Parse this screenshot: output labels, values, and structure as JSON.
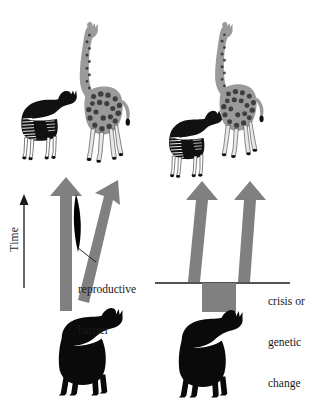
{
  "figure": {
    "background_color": "#ffffff",
    "arrow_color": "#808080",
    "barrier_color": "#000000",
    "ink_color": "#1a1a1a",
    "axis": {
      "label": "Time",
      "direction": "upward"
    },
    "panels": [
      {
        "id": "left",
        "model": "reproductive-barrier-speciation",
        "annotation": {
          "line1": "reproductive",
          "line2": "barrier"
        },
        "descendants": [
          "okapi",
          "giraffe"
        ],
        "ancestor": "ancestral-giraffe-silhouette",
        "arrows": 2
      },
      {
        "id": "right",
        "model": "crisis-or-genetic-change-speciation",
        "annotation": {
          "line1": "crisis or",
          "line2": "genetic",
          "line3": "change"
        },
        "descendants": [
          "okapi",
          "giraffe"
        ],
        "ancestor": "ancestral-giraffe-silhouette",
        "arrows": 2
      }
    ]
  }
}
